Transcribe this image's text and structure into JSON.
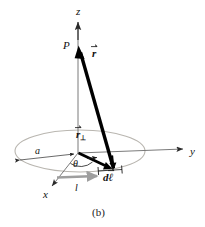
{
  "figure": {
    "caption": "(b)",
    "background_color": "#ffffff",
    "ink_color": "#111111",
    "axis_color": "#555555",
    "loop_color": "#b9b6b0",
    "highlight_color": "#9e9e9e"
  },
  "axes": [
    {
      "name": "z-axis",
      "label": "z",
      "direction": "up",
      "label_x": 76,
      "label_y": 6
    },
    {
      "name": "y-axis",
      "label": "y",
      "direction": "right",
      "label_x": 190,
      "label_y": 147
    },
    {
      "name": "x-axis",
      "label": "x",
      "direction": "down-left",
      "label_x": 43,
      "label_y": 190
    }
  ],
  "points": [
    {
      "name": "field-point",
      "label": "P",
      "label_x": 64,
      "label_y": 41
    }
  ],
  "vectors": [
    {
      "name": "r-vector",
      "base": "r",
      "subscript": "",
      "has_arrow_accent": true,
      "label_x": 92,
      "label_y": 49,
      "description": "separation vector from source element to field point P"
    },
    {
      "name": "r-perp-vector",
      "base": "r",
      "subscript": "⊥",
      "has_arrow_accent": true,
      "label_x": 76,
      "label_y": 130,
      "description": "perpendicular component of r in the loop plane"
    },
    {
      "name": "dl-vector",
      "base": "dℓ",
      "subscript": "",
      "has_arrow_accent": true,
      "label_x": 103,
      "label_y": 173,
      "description": "differential current element along the loop"
    }
  ],
  "annotations": [
    {
      "name": "radius-label",
      "label": "a",
      "label_x": 35,
      "label_y": 147,
      "style": "italic"
    },
    {
      "name": "angle-label",
      "label": "θ",
      "label_x": 74,
      "label_y": 160,
      "style": "italic"
    },
    {
      "name": "current-label",
      "label": "l",
      "label_x": 75,
      "label_y": 184,
      "style": "italic"
    }
  ],
  "geometry": {
    "origin": {
      "x": 78,
      "y": 153
    },
    "loop": {
      "cx": 80,
      "cy": 151,
      "rx": 65,
      "ry": 21
    },
    "point_P": {
      "x": 78,
      "y": 48
    },
    "source_element": {
      "x": 113,
      "y": 168
    }
  }
}
